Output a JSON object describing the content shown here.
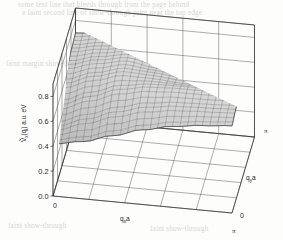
{
  "figure": {
    "kind": "3d-surface-plot",
    "background_color": "#fdfdfc",
    "line_color": "#3a3a3a",
    "mesh_color": "#555555",
    "surface_fill": "#b9b9b9"
  },
  "bleed_text": {
    "line1": "some text line  that  bleeds  through  from  the  page  behind",
    "line2": "a faint second line of show-through print near the top edge",
    "line3": "faint margin show-through",
    "line4": "faint show-through",
    "line5": "faint show-through"
  },
  "chart_data": {
    "type": "surface",
    "title": "",
    "subtitle": "",
    "xlabel": "q",
    "xlabel_sub": "x",
    "xlabel_suffix": "a",
    "ylabel": "q",
    "ylabel_sub": "y",
    "ylabel_suffix": "a",
    "zlabel": "V",
    "zlabel_sub": "x",
    "zlabel_arg": "(q",
    "zlabel_arg_sub": "i",
    "zlabel_arg_close": ") a.u. eV",
    "zlabel_full": "Ṽx(qi) a.u. eV",
    "x_axis_label_text": "qxa",
    "y_axis_label_text": "qya",
    "xlim": [
      0,
      3.14159
    ],
    "ylim": [
      0,
      3.14159
    ],
    "zlim": [
      0.0,
      0.9
    ],
    "x_tick_labels": [
      "0",
      "π"
    ],
    "y_tick_labels": [
      "0",
      "π"
    ],
    "z_tick_labels": [
      "0.0",
      "0.2",
      "0.4",
      "0.6",
      "0.8"
    ],
    "z_tick_values": [
      0.0,
      0.2,
      0.4,
      0.6,
      0.8
    ],
    "grid": true,
    "grid_divisions_x": 5,
    "grid_divisions_y": 5,
    "mesh_divisions": 24,
    "legend": "none",
    "corner_values": {
      "front_left": 0.42,
      "front_right": 0.52,
      "back_left": 0.88,
      "back_right": 0.9,
      "center": 0.66
    },
    "z_values": [
      [
        0.42,
        0.46,
        0.53,
        0.6,
        0.65,
        0.68,
        0.7
      ],
      [
        0.46,
        0.54,
        0.62,
        0.68,
        0.71,
        0.72,
        0.73
      ],
      [
        0.53,
        0.62,
        0.7,
        0.74,
        0.75,
        0.75,
        0.76
      ],
      [
        0.6,
        0.68,
        0.74,
        0.73,
        0.71,
        0.72,
        0.78
      ],
      [
        0.65,
        0.71,
        0.75,
        0.71,
        0.68,
        0.74,
        0.84
      ],
      [
        0.68,
        0.72,
        0.75,
        0.72,
        0.74,
        0.82,
        0.89
      ],
      [
        0.7,
        0.73,
        0.76,
        0.78,
        0.84,
        0.89,
        0.9
      ]
    ]
  }
}
